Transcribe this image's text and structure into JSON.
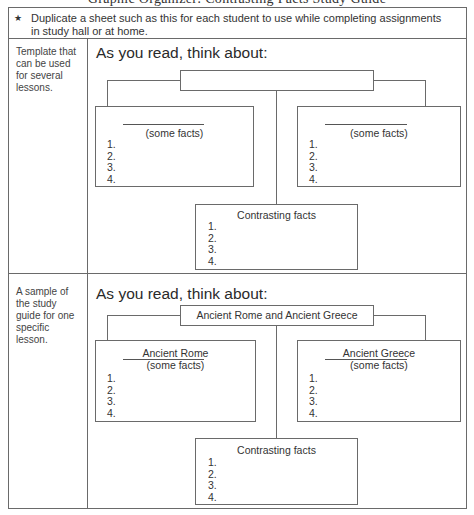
{
  "page": {
    "clipped_title": "Graphic Organizer: Contrasting Facts Study Guide",
    "note": {
      "icon": "asterisk",
      "text": "Duplicate a sheet such as this for each student to use while completing assignments in study hall or at home."
    },
    "rows": [
      {
        "side_label": "Template that can be used for several lessons.",
        "heading": "As you read, think about:",
        "topic": "",
        "left_box": {
          "title": "",
          "subtitle": "(some facts)",
          "items": [
            "1.",
            "2.",
            "3.",
            "4."
          ]
        },
        "right_box": {
          "title": "",
          "subtitle": "(some facts)",
          "items": [
            "1.",
            "2.",
            "3.",
            "4."
          ]
        },
        "contrast_box": {
          "title": "Contrasting facts",
          "items": [
            "1.",
            "2.",
            "3.",
            "4."
          ]
        }
      },
      {
        "side_label": "A sample of the study guide for one specific lesson.",
        "heading": "As you read, think about:",
        "topic": "Ancient Rome and Ancient Greece",
        "left_box": {
          "title": "Ancient Rome",
          "subtitle": "(some facts)",
          "items": [
            "1.",
            "2.",
            "3.",
            "4."
          ]
        },
        "right_box": {
          "title": "Ancient Greece",
          "subtitle": "(some facts)",
          "items": [
            "1.",
            "2.",
            "3.",
            "4."
          ]
        },
        "contrast_box": {
          "title": "Contrasting facts",
          "items": [
            "1.",
            "2.",
            "3.",
            "4."
          ]
        }
      }
    ]
  },
  "colors": {
    "border": "#6a6a6a",
    "text": "#2a2a2a",
    "background": "#ffffff"
  }
}
